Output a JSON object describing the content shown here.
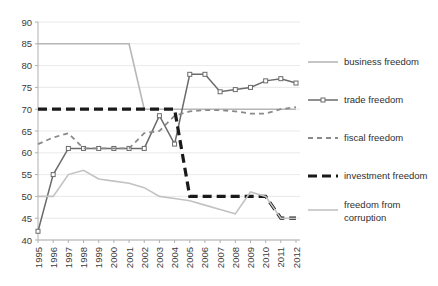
{
  "chart_data": {
    "type": "line",
    "title": "",
    "xlabel": "",
    "ylabel": "",
    "grid": true,
    "legend_position": "right",
    "x": [
      1995,
      1996,
      1997,
      1998,
      1999,
      2000,
      2001,
      2002,
      2003,
      2004,
      2005,
      2006,
      2007,
      2008,
      2009,
      2010,
      2011,
      2012
    ],
    "categories": [
      "1995",
      "1996",
      "1997",
      "1998",
      "1999",
      "2000",
      "2001",
      "2002",
      "2003",
      "2004",
      "2005",
      "2006",
      "2007",
      "2008",
      "2009",
      "2010",
      "2011",
      "2012"
    ],
    "xlim": [
      1995,
      2012
    ],
    "ylim": [
      40,
      90
    ],
    "ytick_values": [
      40,
      45,
      50,
      55,
      60,
      65,
      70,
      75,
      80,
      85,
      90
    ],
    "ytick_labels": [
      "40",
      "45",
      "50",
      "55",
      "60",
      "65",
      "70",
      "75",
      "80",
      "85",
      "90"
    ],
    "series": [
      {
        "name": "business freedom",
        "color": "#b7b7b7",
        "style": "solid",
        "width": 1.6,
        "marker": "none",
        "values": [
          85,
          85,
          85,
          85,
          85,
          85,
          85,
          70,
          70,
          70,
          70,
          70,
          70,
          70,
          70,
          70,
          70,
          70
        ]
      },
      {
        "name": "trade freedom",
        "color": "#6b6b6b",
        "style": "solid",
        "width": 1.5,
        "marker": "square",
        "values": [
          42,
          55,
          61,
          61,
          61,
          61,
          61,
          61,
          68.5,
          62,
          78,
          78,
          74,
          74.5,
          75,
          76.5,
          77,
          76
        ]
      },
      {
        "name": "fiscal freedom",
        "color": "#8a8a8a",
        "style": "dashed",
        "width": 1.8,
        "marker": "none",
        "values": [
          62,
          63.5,
          64.5,
          61,
          61,
          61,
          61,
          64.5,
          65,
          68.5,
          69.5,
          69.8,
          69.8,
          69.5,
          69,
          69,
          70,
          70.5
        ]
      },
      {
        "name": "investment freedom",
        "color": "#1a1a1a",
        "style": "dashed",
        "width": 3.2,
        "marker": "none",
        "values": [
          70,
          70,
          70,
          70,
          70,
          70,
          70,
          70,
          70,
          70,
          50,
          50,
          50,
          50,
          50,
          50,
          45,
          45
        ]
      },
      {
        "name": "freedom from corruption",
        "color": "#c2c2c2",
        "style": "solid",
        "width": 1.6,
        "marker": "none",
        "values": [
          50,
          50,
          55,
          56,
          54,
          53.5,
          53,
          52,
          50,
          49.5,
          49,
          48,
          47,
          46,
          51,
          50,
          45,
          45
        ]
      }
    ]
  },
  "legend": {
    "items": [
      {
        "label": "business freedom"
      },
      {
        "label": "trade freedom"
      },
      {
        "label": "fiscal freedom"
      },
      {
        "label": "investment freedom"
      },
      {
        "label": "freedom from corruption"
      }
    ]
  },
  "colors": {
    "grid": "#e3e3e3",
    "axis": "#b0b0b0",
    "background": "#ffffff",
    "text": "#3b3b3b"
  }
}
